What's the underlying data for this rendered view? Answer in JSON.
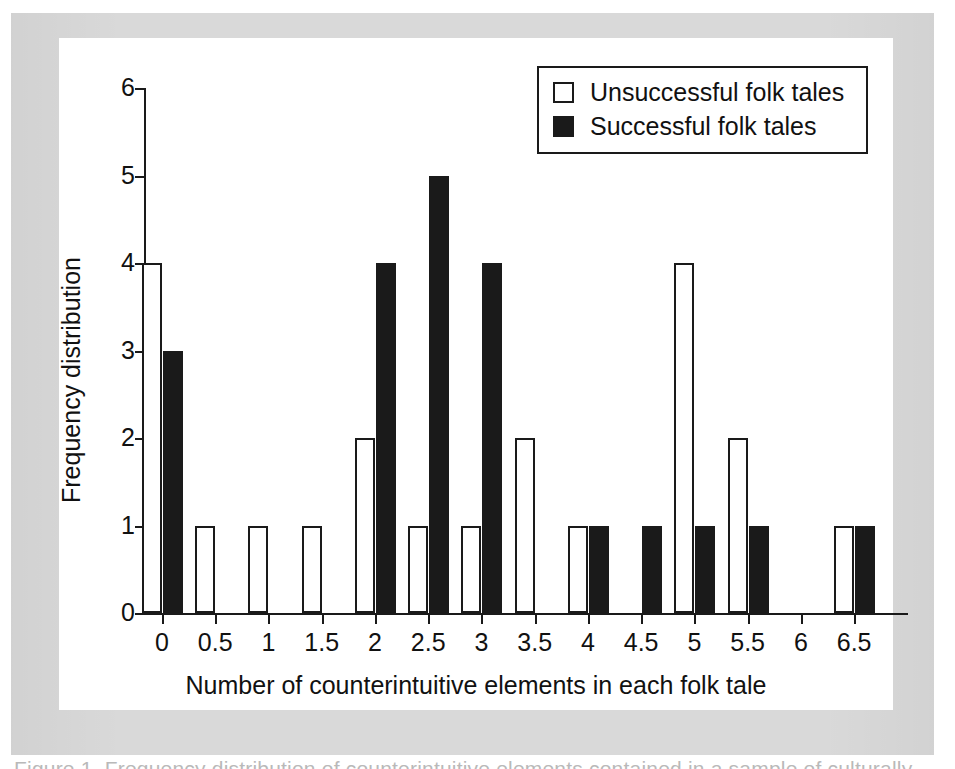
{
  "figure": {
    "caption_partial": "Figure 1.  Frequency distribution of counterintuitive elements contained in a sample of culturally"
  },
  "chart_data": {
    "type": "bar",
    "title": "",
    "xlabel": "Number of counterintuitive elements in each folk tale",
    "ylabel": "Frequency distribution",
    "categories": [
      "0",
      "0.5",
      "1",
      "1.5",
      "2",
      "2.5",
      "3",
      "3.5",
      "4",
      "4.5",
      "5",
      "5.5",
      "6",
      "6.5"
    ],
    "series": [
      {
        "name": "Unsuccessful folk tales",
        "swatch": "hollow",
        "color": "#ffffff",
        "edge_color": "#1a1a1a",
        "values": [
          4,
          1,
          1,
          1,
          2,
          1,
          1,
          2,
          1,
          0,
          4,
          2,
          0,
          1
        ]
      },
      {
        "name": "Successful folk tales",
        "swatch": "filled",
        "color": "#1a1a1a",
        "edge_color": "#1a1a1a",
        "values": [
          3,
          0,
          0,
          0,
          4,
          5,
          4,
          0,
          1,
          1,
          1,
          1,
          0,
          1
        ]
      }
    ],
    "ylim": [
      0,
      6
    ],
    "yticks": [
      "0",
      "1",
      "2",
      "3",
      "4",
      "5",
      "6"
    ],
    "xticks": [
      "0",
      "0.5",
      "1",
      "1.5",
      "2",
      "2.5",
      "3",
      "3.5",
      "4",
      "4.5",
      "5",
      "5.5",
      "6",
      "6.5"
    ],
    "grid": false,
    "legend_position": "top-right",
    "legend_entries": [
      "Unsuccessful folk tales",
      "Successful folk tales"
    ]
  },
  "colors": {
    "page_background": "#ffffff",
    "frame_gray": "#d9d9d9",
    "panel_white": "#ffffff",
    "ink": "#1a1a1a"
  }
}
